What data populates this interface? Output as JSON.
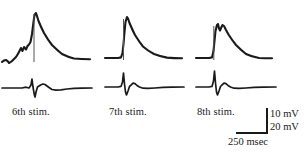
{
  "figure": {
    "type": "electrophysiology-recording-traces",
    "background": "#ffffff",
    "trace_color": "#1a1a1a",
    "width": 307,
    "height": 158
  },
  "panels": [
    {
      "label": "6th stim.",
      "x": 0,
      "upper_trace": {
        "name": "intracellular-potential",
        "baseline_y": 59,
        "peak_x": 36,
        "peak_y": 13,
        "peak_amplitude_mV": 46,
        "shape": "prepotential-oscillations then fast rising spike to tall single peak with slow exponential decay to elevated plateau",
        "points": "2,62 6,60 9,63 12,61 16,57 19,52 21,48 23,51 25,47 27,49 29,44 31,42 33,30 34,20 35,14 36,13 38,17 40,23 43,30 46,36 50,43 55,49 60,53 66,56 72,58 78,59 84,59 90,59"
      },
      "lower_trace": {
        "name": "extracellular-potential",
        "baseline_y": 88,
        "shape": "flat baseline with sharp downward spike then small positive deflection and slow return",
        "points": "2,88 10,88 18,88 24,87 28,88 31,85 32,80 33,86 34,93 35,97 36,93 38,87 40,86 42,85 44,84 46,85 48,86 50,88 54,90 58,90 64,89 70,89 78,88 86,88 92,88"
      }
    },
    {
      "label": "7th stim.",
      "x": 97,
      "upper_trace": {
        "name": "intracellular-potential",
        "baseline_y": 58,
        "peak_x": 127,
        "peak_y": 17,
        "peak_amplitude_mV": 41,
        "shape": "flat baseline then fast rising spike to single peak with exponential decay to plateau",
        "points": "105,58 112,58 118,58 121,57 123,52 124,43 125,31 126,22 127,17 128,18 130,23 132,29 135,35 138,41 142,46 146,50 151,53 157,55 163,57 170,58 176,58 182,58"
      },
      "lower_trace": {
        "name": "extracellular-potential",
        "baseline_y": 87,
        "shape": "flat baseline with sharp downward spike then small positive bump and return",
        "points": "105,87 112,87 118,87 121,86 123,82 124,74 125,84 126,92 127,95 128,92 130,86 132,85 134,83 136,84 138,86 141,87 145,88 150,88 156,88 163,87 170,87 178,87 184,87"
      }
    },
    {
      "label": "8th stim.",
      "x": 190,
      "upper_trace": {
        "name": "intracellular-potential",
        "baseline_y": 58,
        "peak_x": 218,
        "peak_y": 24,
        "peak_amplitude_mV": 34,
        "shape": "fast rising spike to notched double peak (two humps) then decay to plateau",
        "points": "196,58 203,58 209,58 212,57 214,51 215,40 216,30 217,25 218,24 219,28 220,30 221,28 222,25 224,26 226,30 228,34 231,39 234,44 238,49 242,53 247,56 252,57 258,58 264,58 270,58"
      },
      "lower_trace": {
        "name": "extracellular-potential",
        "baseline_y": 87,
        "shape": "flat baseline with sharp downward spike then small positive bump and slow return",
        "points": "196,87 203,87 209,87 212,86 214,81 215,72 216,83 217,92 218,95 219,92 221,87 223,85 225,83 227,84 229,86 232,87 236,88 241,88 247,87 253,87 260,87 268,87 274,87"
      }
    }
  ],
  "scalebar": {
    "name": "calibration-scale-bar",
    "vertical_upper": "10 mV",
    "vertical_lower": "20 mV",
    "horizontal": "250 msec"
  }
}
